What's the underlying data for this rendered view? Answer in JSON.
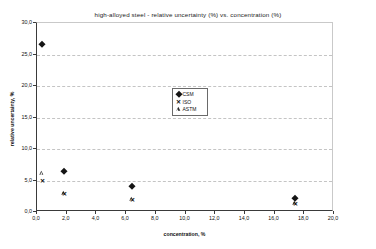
{
  "chart_data": {
    "type": "scatter",
    "title": "high-alloyed steel - relative uncertainty (%) vs. concentration (%)",
    "xlabel": "concentration, %",
    "ylabel": "relative uncertainty, %",
    "xlim": [
      0.0,
      20.0
    ],
    "ylim": [
      0.0,
      30.0
    ],
    "grid": "horizontal-dashed",
    "legend_position": "center",
    "xticks": [
      "0,0",
      "2,0",
      "4,0",
      "6,0",
      "8,0",
      "10,0",
      "12,0",
      "14,0",
      "16,0",
      "18,0",
      "20,0"
    ],
    "xtick_values": [
      0,
      2,
      4,
      6,
      8,
      10,
      12,
      14,
      16,
      18,
      20
    ],
    "yticks": [
      "0,0",
      "5,0",
      "10,0",
      "15,0",
      "20,0",
      "25,0",
      "30,0"
    ],
    "ytick_values": [
      0,
      5,
      10,
      15,
      20,
      25,
      30
    ],
    "series": [
      {
        "name": "CSM",
        "marker": "filled-diamond",
        "color": "#151515",
        "points": [
          {
            "x": 0.35,
            "y": 26.7
          },
          {
            "x": 1.85,
            "y": 6.5
          },
          {
            "x": 6.4,
            "y": 4.2
          },
          {
            "x": 17.4,
            "y": 2.2
          }
        ]
      },
      {
        "name": "ISO",
        "marker": "cross-x",
        "color": "#151515",
        "points": [
          {
            "x": 0.35,
            "y": 5.0
          },
          {
            "x": 1.85,
            "y": 2.8
          },
          {
            "x": 6.4,
            "y": 1.9
          },
          {
            "x": 17.4,
            "y": 1.2
          }
        ]
      },
      {
        "name": "ASTM",
        "marker": "open-triangle",
        "color": "#2b2b2b",
        "points": [
          {
            "x": 0.35,
            "y": 6.2
          },
          {
            "x": 1.85,
            "y": 3.0
          },
          {
            "x": 6.4,
            "y": 2.1
          },
          {
            "x": 17.4,
            "y": 1.4
          }
        ]
      }
    ]
  }
}
